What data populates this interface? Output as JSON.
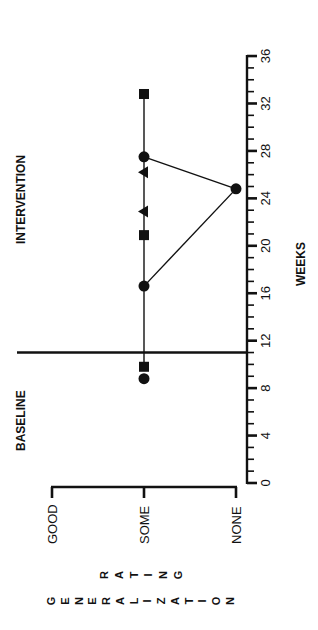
{
  "chart_data": {
    "type": "line",
    "orientation": "rotated 90deg (weeks run vertically, rating horizontally)",
    "title": "",
    "xlabel": "WEEKS",
    "ylabel": "GENERALIZATION RATING",
    "x_ticks": {
      "major": [
        0,
        4,
        8,
        12,
        16,
        20,
        24,
        28,
        32,
        36
      ],
      "minor_step": 1
    },
    "xlim": [
      0,
      36
    ],
    "y_categories": [
      "NONE",
      "SOME",
      "GOOD"
    ],
    "phases": [
      {
        "label": "BASELINE",
        "range": [
          0,
          11
        ]
      },
      {
        "label": "INTERVENTION",
        "range": [
          11,
          36
        ]
      }
    ],
    "phase_change_week": 11,
    "series": [
      {
        "name": "square",
        "marker": "square",
        "points": [
          {
            "week": 9.8,
            "rating": "SOME"
          },
          {
            "week": 20.9,
            "rating": "SOME"
          },
          {
            "week": 32.8,
            "rating": "SOME"
          }
        ]
      },
      {
        "name": "circle",
        "marker": "circle",
        "points": [
          {
            "week": 8.8,
            "rating": "SOME"
          },
          {
            "week": 16.6,
            "rating": "SOME"
          },
          {
            "week": 24.8,
            "rating": "NONE"
          },
          {
            "week": 27.5,
            "rating": "SOME"
          }
        ]
      },
      {
        "name": "triangle",
        "marker": "triangle",
        "points": [
          {
            "week": 22.9,
            "rating": "SOME"
          },
          {
            "week": 26.2,
            "rating": "SOME"
          }
        ]
      }
    ],
    "connecting_lines": [
      {
        "from": {
          "week": 9.8,
          "rating": "SOME"
        },
        "to": {
          "week": 32.8,
          "rating": "SOME"
        }
      },
      {
        "from": {
          "week": 16.6,
          "rating": "SOME"
        },
        "to": {
          "week": 24.8,
          "rating": "NONE"
        }
      },
      {
        "from": {
          "week": 24.8,
          "rating": "NONE"
        },
        "to": {
          "week": 27.5,
          "rating": "SOME"
        }
      }
    ],
    "grid": false,
    "legend": null
  },
  "labels": {
    "phase_baseline": "BASELINE",
    "phase_intervention": "INTERVENTION",
    "weeks_axis_title": "WEEKS",
    "rating_axis_title_line1": "RATING",
    "rating_axis_title_line2": "GENERALIZATION",
    "rating_good": "GOOD",
    "rating_some": "SOME",
    "rating_none": "NONE"
  },
  "colors": {
    "ink": "#111111",
    "background": "#ffffff"
  }
}
